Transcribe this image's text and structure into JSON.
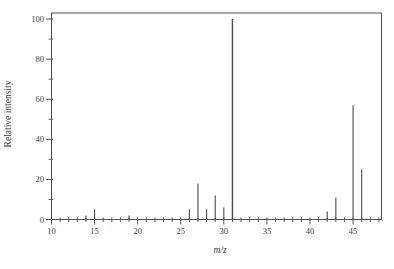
{
  "figure": {
    "background": "#ffffff",
    "ink": "#3f3f3f",
    "peak_color": "#4a4a4a"
  },
  "chart_data": {
    "type": "bar",
    "subtype": "mass-spectrum-stick-plot",
    "title": "",
    "xlabel": "m/z",
    "ylabel": "Relative intensity",
    "xlim": [
      10,
      48.3
    ],
    "ylim": [
      0,
      103
    ],
    "x_major_ticks": [
      10,
      15,
      20,
      25,
      30,
      35,
      40,
      45
    ],
    "x_minor_tick_step": 1,
    "y_major_ticks": [
      0,
      20,
      40,
      60,
      80,
      100
    ],
    "y_minor_tick_step": 10,
    "grid": "off",
    "legend": "none",
    "peaks": [
      {
        "mz": 14,
        "intensity": 2
      },
      {
        "mz": 15,
        "intensity": 5
      },
      {
        "mz": 19,
        "intensity": 2
      },
      {
        "mz": 26,
        "intensity": 5
      },
      {
        "mz": 27,
        "intensity": 18
      },
      {
        "mz": 28,
        "intensity": 5
      },
      {
        "mz": 29,
        "intensity": 12
      },
      {
        "mz": 30,
        "intensity": 6
      },
      {
        "mz": 31,
        "intensity": 100
      },
      {
        "mz": 42,
        "intensity": 4
      },
      {
        "mz": 43,
        "intensity": 11
      },
      {
        "mz": 45,
        "intensity": 57
      },
      {
        "mz": 46,
        "intensity": 25
      }
    ]
  }
}
